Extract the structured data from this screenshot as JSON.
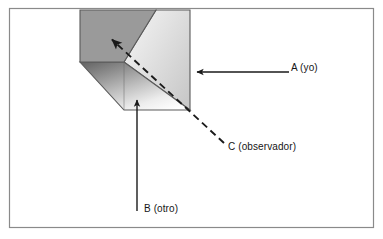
{
  "figure": {
    "type": "perspective-box-diagram",
    "frame": {
      "name": "outer-border",
      "stroke_color": "#8a8a8a",
      "fill_color": "#ffffff",
      "x": 9,
      "y": 8,
      "width": 365,
      "height": 220
    },
    "box": {
      "name": "three-dimensional-box",
      "outline_color": "#555555",
      "faces": [
        {
          "name": "top-face",
          "fill": "#9a9a9a",
          "points": "80,10 156,10 124,62 80,62"
        },
        {
          "name": "front-left-face",
          "gradient_from": "#6e6e6e",
          "gradient_to": "#ffffff",
          "points": "80,62 124,62 190,110 124,110"
        },
        {
          "name": "right-face",
          "gradient_from": "#f2f2f2",
          "gradient_to": "#cfcfcf",
          "points": "156,10 190,10 190,110 124,62"
        }
      ]
    },
    "arrows": [
      {
        "id": "A",
        "name": "arrow-a-yo",
        "label": "A (yo)",
        "style": "solid",
        "color": "#1a1a1a",
        "direction": "left",
        "from_x": 289,
        "from_y": 72,
        "to_x": 196,
        "to_y": 72
      },
      {
        "id": "B",
        "name": "arrow-b-otro",
        "label": "B (otro)",
        "style": "solid",
        "color": "#1a1a1a",
        "direction": "up",
        "from_x": 137,
        "from_y": 211,
        "to_x": 137,
        "to_y": 99
      },
      {
        "id": "C",
        "name": "arrow-c-observador",
        "label": "C (observador)",
        "style": "dashed",
        "color": "#1a1a1a",
        "direction": "up-left",
        "from_x": 224,
        "from_y": 143,
        "to_x": 110,
        "to_y": 38
      }
    ]
  },
  "labels": {
    "a": "A (yo)",
    "b": "B (otro)",
    "c": "C (observador)"
  },
  "colors": {
    "ink": "#1a1a1a",
    "frame": "#8a8a8a",
    "box_outline": "#555555",
    "top_face": "#9a9a9a",
    "background": "#ffffff"
  }
}
